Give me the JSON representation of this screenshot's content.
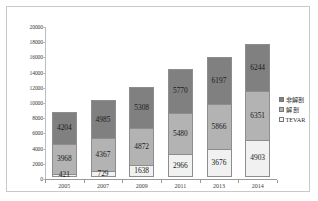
{
  "chart_data": {
    "type": "bar",
    "subtype": "stacked-column",
    "title": "",
    "xlabel": "",
    "ylabel": "",
    "categories": [
      "2005",
      "2007",
      "2009",
      "2011",
      "2013",
      "2014"
    ],
    "series": [
      {
        "name": "TEVAR",
        "values": [
          421,
          729,
          1638,
          2966,
          3676,
          4903
        ]
      },
      {
        "name": "解  剖",
        "values": [
          3968,
          4367,
          4872,
          5480,
          5866,
          6351
        ]
      },
      {
        "name": "非解剖",
        "values": [
          4204,
          4985,
          5308,
          5770,
          6197,
          6244
        ]
      }
    ],
    "stack_order_bottom_to_top": [
      "TEVAR",
      "解  剖",
      "非解剖"
    ],
    "totals": [
      8593,
      10081,
      11818,
      14216,
      15739,
      17498
    ],
    "ylim": [
      0,
      20000
    ],
    "ytick_step": 2000,
    "yticks": [
      "0",
      "2000",
      "4000",
      "6000",
      "8000",
      "10000",
      "12000",
      "14000",
      "16000",
      "18000",
      "20000"
    ],
    "grid": false,
    "legend_position": "right",
    "colors": {
      "series_top": "#808080",
      "series_mid": "#b3b3b3",
      "series_bottom": "#f1f1f1",
      "axis": "#9a9a9a",
      "text": "#2b2b2b",
      "frame": "#c9c9c9",
      "background": "#ffffff"
    }
  },
  "legend": {
    "items": [
      {
        "label": "非解剖",
        "swatch": "series_top"
      },
      {
        "label": "解  剖",
        "swatch": "series_mid"
      },
      {
        "label": "TEVAR",
        "swatch": "series_bottom"
      }
    ]
  }
}
